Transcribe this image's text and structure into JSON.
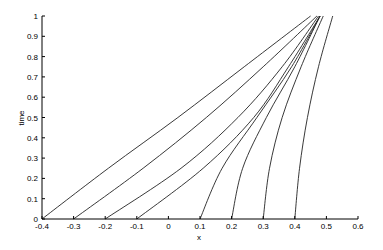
{
  "chart_data": {
    "type": "line",
    "title": "",
    "xlabel": "x",
    "ylabel": "time",
    "xlim": [
      -0.4,
      0.6
    ],
    "ylim": [
      0,
      1
    ],
    "grid": false,
    "legend": null,
    "xticks": [
      -0.4,
      -0.3,
      -0.2,
      -0.1,
      0,
      0.1,
      0.2,
      0.3,
      0.4,
      0.5,
      0.6
    ],
    "xtick_labels": [
      "-0.4",
      "-0.3",
      "-0.2",
      "-0.1",
      "0",
      "0.1",
      "0.2",
      "0.3",
      "0.4",
      "0.5",
      "0.6"
    ],
    "yticks": [
      0,
      0.1,
      0.2,
      0.3,
      0.4,
      0.5,
      0.6,
      0.7,
      0.8,
      0.9,
      1
    ],
    "ytick_labels": [
      "0",
      "0.1",
      "0.2",
      "0.3",
      "0.4",
      "0.5",
      "0.6",
      "0.7",
      "0.8",
      "0.9",
      "1"
    ],
    "series": [
      {
        "name": "x0=-0.4",
        "x": [
          -0.4,
          -0.19,
          0.03,
          0.24,
          0.45
        ],
        "t": [
          0,
          0.25,
          0.5,
          0.75,
          1
        ]
      },
      {
        "name": "x0=-0.3",
        "x": [
          -0.3,
          -0.08,
          0.12,
          0.3,
          0.47
        ],
        "t": [
          0,
          0.25,
          0.5,
          0.75,
          1
        ]
      },
      {
        "name": "x0=-0.2",
        "x": [
          -0.2,
          0.04,
          0.22,
          0.36,
          0.475
        ],
        "t": [
          0,
          0.25,
          0.5,
          0.75,
          1
        ]
      },
      {
        "name": "x0=-0.1",
        "x": [
          -0.1,
          0.11,
          0.27,
          0.38,
          0.48
        ],
        "t": [
          0,
          0.25,
          0.5,
          0.75,
          1
        ]
      },
      {
        "name": "x0=0.1",
        "x": [
          0.1,
          0.17,
          0.28,
          0.39,
          0.48
        ],
        "t": [
          0,
          0.25,
          0.5,
          0.75,
          1
        ]
      },
      {
        "name": "x0=0.2",
        "x": [
          0.2,
          0.235,
          0.31,
          0.4,
          0.48
        ],
        "t": [
          0,
          0.25,
          0.5,
          0.75,
          1
        ]
      },
      {
        "name": "x0=0.3",
        "x": [
          0.3,
          0.32,
          0.36,
          0.42,
          0.49
        ],
        "t": [
          0,
          0.25,
          0.5,
          0.75,
          1
        ]
      },
      {
        "name": "x0=0.4",
        "x": [
          0.4,
          0.415,
          0.44,
          0.475,
          0.52
        ],
        "t": [
          0,
          0.25,
          0.5,
          0.75,
          1
        ]
      }
    ]
  }
}
